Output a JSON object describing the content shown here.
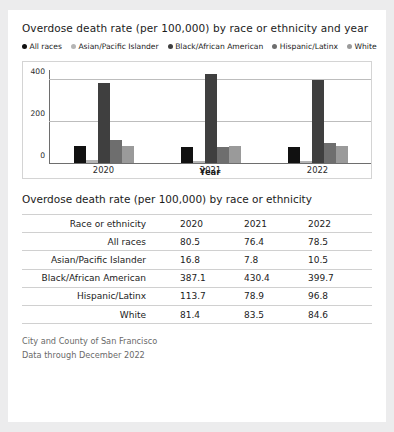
{
  "chart_data": {
    "type": "bar",
    "title": "Overdose death rate (per 100,000) by race or ethnicity and year",
    "xlabel": "Year",
    "ylabel": "",
    "categories": [
      "2020",
      "2021",
      "2022"
    ],
    "ylim": [
      0,
      450
    ],
    "yticks": [
      0,
      200,
      400
    ],
    "ytick_labels": [
      "0",
      "200",
      "400"
    ],
    "grid": true,
    "legend_position": "top",
    "series": [
      {
        "name": "All races",
        "color": "#111111",
        "values": [
          80.5,
          76.4,
          78.5
        ]
      },
      {
        "name": "Asian/Pacific Islander",
        "color": "#b5b5b5",
        "values": [
          16.8,
          7.8,
          10.5
        ]
      },
      {
        "name": "Black/African American",
        "color": "#3f3f3f",
        "values": [
          387.1,
          430.4,
          399.7
        ]
      },
      {
        "name": "Hispanic/Latinx",
        "color": "#6e6e6e",
        "values": [
          113.7,
          78.9,
          96.8
        ]
      },
      {
        "name": "White",
        "color": "#9a9a9a",
        "values": [
          81.4,
          83.5,
          84.6
        ]
      }
    ]
  },
  "table": {
    "title": "Overdose death rate (per 100,000) by race or ethnicity",
    "headers": [
      "Race or ethnicity",
      "2020",
      "2021",
      "2022"
    ],
    "rows": [
      {
        "label": "All races",
        "values": [
          "80.5",
          "76.4",
          "78.5"
        ]
      },
      {
        "label": "Asian/Pacific Islander",
        "values": [
          "16.8",
          "7.8",
          "10.5"
        ]
      },
      {
        "label": "Black/African American",
        "values": [
          "387.1",
          "430.4",
          "399.7"
        ]
      },
      {
        "label": "Hispanic/Latinx",
        "values": [
          "113.7",
          "78.9",
          "96.8"
        ]
      },
      {
        "label": "White",
        "values": [
          "81.4",
          "83.5",
          "84.6"
        ]
      }
    ]
  },
  "footer": {
    "line1": "City and County of San Francisco",
    "line2": "Data through December 2022"
  }
}
